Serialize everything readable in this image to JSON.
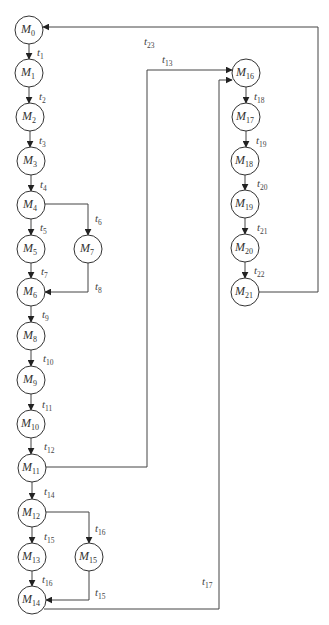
{
  "diagram": {
    "type": "reachability-graph",
    "node_radius": 14,
    "colors": {
      "stroke": "#333333",
      "background": "#ffffff"
    },
    "nodes": [
      {
        "id": "M0",
        "base": "M",
        "sub": "0",
        "x": 29,
        "y": 30
      },
      {
        "id": "M1",
        "base": "M",
        "sub": "1",
        "x": 29,
        "y": 73
      },
      {
        "id": "M2",
        "base": "M",
        "sub": "2",
        "x": 30,
        "y": 117
      },
      {
        "id": "M3",
        "base": "M",
        "sub": "3",
        "x": 31,
        "y": 161
      },
      {
        "id": "M4",
        "base": "M",
        "sub": "4",
        "x": 31,
        "y": 205
      },
      {
        "id": "M5",
        "base": "M",
        "sub": "5",
        "x": 31,
        "y": 249
      },
      {
        "id": "M7",
        "base": "M",
        "sub": "7",
        "x": 88,
        "y": 249
      },
      {
        "id": "M6",
        "base": "M",
        "sub": "6",
        "x": 31,
        "y": 292
      },
      {
        "id": "M8",
        "base": "M",
        "sub": "8",
        "x": 31,
        "y": 336
      },
      {
        "id": "M9",
        "base": "M",
        "sub": "9",
        "x": 31,
        "y": 380
      },
      {
        "id": "M10",
        "base": "M",
        "sub": "10",
        "x": 31,
        "y": 424
      },
      {
        "id": "M11",
        "base": "M",
        "sub": "11",
        "x": 32,
        "y": 468
      },
      {
        "id": "M12",
        "base": "M",
        "sub": "12",
        "x": 32,
        "y": 513
      },
      {
        "id": "M13",
        "base": "M",
        "sub": "13",
        "x": 32,
        "y": 557
      },
      {
        "id": "M15",
        "base": "M",
        "sub": "15",
        "x": 89,
        "y": 557
      },
      {
        "id": "M14",
        "base": "M",
        "sub": "14",
        "x": 32,
        "y": 600
      },
      {
        "id": "M16",
        "base": "M",
        "sub": "16",
        "x": 246,
        "y": 73
      },
      {
        "id": "M17",
        "base": "M",
        "sub": "17",
        "x": 246,
        "y": 117
      },
      {
        "id": "M18",
        "base": "M",
        "sub": "18",
        "x": 245,
        "y": 161
      },
      {
        "id": "M19",
        "base": "M",
        "sub": "19",
        "x": 245,
        "y": 204
      },
      {
        "id": "M20",
        "base": "M",
        "sub": "20",
        "x": 245,
        "y": 248
      },
      {
        "id": "M21",
        "base": "M",
        "sub": "21",
        "x": 245,
        "y": 292
      }
    ],
    "edges": [
      {
        "from": "M0",
        "to": "M1",
        "label": "t",
        "sub": "1",
        "points": [
          [
            29,
            44
          ],
          [
            29,
            59
          ]
        ],
        "lx": 37,
        "ly": 56
      },
      {
        "from": "M1",
        "to": "M2",
        "label": "t",
        "sub": "2",
        "points": [
          [
            29,
            87
          ],
          [
            29,
            103
          ]
        ],
        "lx": 39,
        "ly": 100
      },
      {
        "from": "M2",
        "to": "M3",
        "label": "t",
        "sub": "3",
        "points": [
          [
            30,
            131
          ],
          [
            30,
            147
          ]
        ],
        "lx": 39,
        "ly": 144
      },
      {
        "from": "M3",
        "to": "M4",
        "label": "t",
        "sub": "4",
        "points": [
          [
            31,
            175
          ],
          [
            31,
            191
          ]
        ],
        "lx": 40,
        "ly": 188
      },
      {
        "from": "M4",
        "to": "M5",
        "label": "t",
        "sub": "5",
        "points": [
          [
            31,
            219
          ],
          [
            31,
            235
          ]
        ],
        "lx": 40,
        "ly": 231
      },
      {
        "from": "M4",
        "to": "M7",
        "label": "t",
        "sub": "6",
        "points": [
          [
            45,
            204
          ],
          [
            88,
            204
          ],
          [
            88,
            235
          ]
        ],
        "lx": 95,
        "ly": 222
      },
      {
        "from": "M5",
        "to": "M6",
        "label": "t",
        "sub": "7",
        "points": [
          [
            31,
            263
          ],
          [
            31,
            278
          ]
        ],
        "lx": 41,
        "ly": 275
      },
      {
        "from": "M7",
        "to": "M6",
        "label": "t",
        "sub": "8",
        "points": [
          [
            88,
            263
          ],
          [
            88,
            292
          ],
          [
            45,
            292
          ]
        ],
        "lx": 95,
        "ly": 290
      },
      {
        "from": "M6",
        "to": "M8",
        "label": "t",
        "sub": "9",
        "points": [
          [
            31,
            306
          ],
          [
            31,
            322
          ]
        ],
        "lx": 42,
        "ly": 318
      },
      {
        "from": "M8",
        "to": "M9",
        "label": "t",
        "sub": "10",
        "points": [
          [
            31,
            350
          ],
          [
            31,
            366
          ]
        ],
        "lx": 43,
        "ly": 362
      },
      {
        "from": "M9",
        "to": "M10",
        "label": "t",
        "sub": "11",
        "points": [
          [
            31,
            394
          ],
          [
            31,
            410
          ]
        ],
        "lx": 42,
        "ly": 408
      },
      {
        "from": "M10",
        "to": "M11",
        "label": "t",
        "sub": "12",
        "points": [
          [
            31,
            438
          ],
          [
            31,
            454
          ]
        ],
        "lx": 44,
        "ly": 450
      },
      {
        "from": "M11",
        "to": "M16",
        "label": "t",
        "sub": "13",
        "points": [
          [
            46,
            467
          ],
          [
            147,
            467
          ],
          [
            147,
            70
          ],
          [
            232,
            70
          ]
        ],
        "lx": 162,
        "ly": 63
      },
      {
        "from": "M11",
        "to": "M12",
        "label": "t",
        "sub": "14",
        "points": [
          [
            32,
            482
          ],
          [
            32,
            499
          ]
        ],
        "lx": 44,
        "ly": 495
      },
      {
        "from": "M12",
        "to": "M13",
        "label": "t",
        "sub": "15",
        "points": [
          [
            32,
            527
          ],
          [
            32,
            543
          ]
        ],
        "lx": 44,
        "ly": 540
      },
      {
        "from": "M12",
        "to": "M15",
        "label": "t",
        "sub": "16",
        "points": [
          [
            46,
            512
          ],
          [
            89,
            512
          ],
          [
            89,
            543
          ]
        ],
        "lx": 95,
        "ly": 532
      },
      {
        "from": "M13",
        "to": "M14",
        "label": "t",
        "sub": "16",
        "points": [
          [
            32,
            571
          ],
          [
            32,
            586
          ]
        ],
        "lx": 42,
        "ly": 583
      },
      {
        "from": "M15",
        "to": "M14",
        "label": "t",
        "sub": "15",
        "points": [
          [
            89,
            571
          ],
          [
            89,
            600
          ],
          [
            46,
            600
          ]
        ],
        "lx": 95,
        "ly": 596
      },
      {
        "from": "M14",
        "to": "M16",
        "label": "t",
        "sub": "17",
        "points": [
          [
            44,
            609
          ],
          [
            219,
            609
          ],
          [
            219,
            80
          ],
          [
            232,
            80
          ]
        ],
        "lx": 202,
        "ly": 585
      },
      {
        "from": "M16",
        "to": "M17",
        "label": "t",
        "sub": "18",
        "points": [
          [
            246,
            87
          ],
          [
            246,
            103
          ]
        ],
        "lx": 254,
        "ly": 100
      },
      {
        "from": "M17",
        "to": "M18",
        "label": "t",
        "sub": "19",
        "points": [
          [
            246,
            131
          ],
          [
            246,
            147
          ]
        ],
        "lx": 256,
        "ly": 144
      },
      {
        "from": "M18",
        "to": "M19",
        "label": "t",
        "sub": "20",
        "points": [
          [
            245,
            175
          ],
          [
            245,
            190
          ]
        ],
        "lx": 257,
        "ly": 187
      },
      {
        "from": "M19",
        "to": "M20",
        "label": "t",
        "sub": "21",
        "points": [
          [
            245,
            218
          ],
          [
            245,
            234
          ]
        ],
        "lx": 257,
        "ly": 231
      },
      {
        "from": "M20",
        "to": "M21",
        "label": "t",
        "sub": "22",
        "points": [
          [
            245,
            262
          ],
          [
            245,
            278
          ]
        ],
        "lx": 254,
        "ly": 274
      },
      {
        "from": "M21",
        "to": "M0",
        "label": "t",
        "sub": "23",
        "points": [
          [
            259,
            292
          ],
          [
            318,
            292
          ],
          [
            318,
            27
          ],
          [
            43,
            27
          ]
        ],
        "lx": 144,
        "ly": 45
      }
    ]
  }
}
